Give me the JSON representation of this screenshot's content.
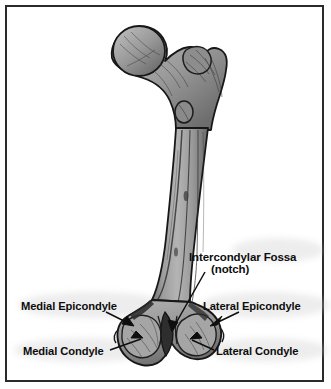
{
  "figure": {
    "view": "posterior view of right femur",
    "background_color": "#ffffff",
    "border_color": "#2a2a2a",
    "bone_fill_color": "#9a9a9a",
    "bone_outline_color": "#1a1a1a",
    "label_color": "#0d0d0d"
  },
  "labels": {
    "intercondylar_fossa": {
      "line1": "Intercondylar Fossa",
      "line2": "(notch)"
    },
    "medial_epicondyle": "Medial Epicondyle",
    "lateral_epicondyle": "Lateral Epicondyle",
    "medial_condyle": "Medial Condyle",
    "lateral_condyle": "Lateral Condyle"
  },
  "anatomy_parts": [
    "head of femur",
    "greater trochanter",
    "neck",
    "lesser trochanter",
    "shaft",
    "medial epicondyle",
    "lateral epicondyle",
    "medial condyle",
    "lateral condyle",
    "intercondylar fossa"
  ]
}
